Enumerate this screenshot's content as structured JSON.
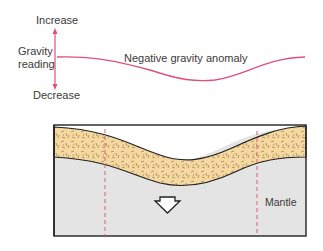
{
  "gravity_profile": {
    "axis_label_line1": "Gravity",
    "axis_label_line2": "reading",
    "increase_label": "Increase",
    "decrease_label": "Decrease",
    "curve_label": "Negative gravity anomaly",
    "curve_color": "#e0507a",
    "arrow_color": "#e0507a"
  },
  "cross_section": {
    "crust_fill": "#f5d9a0",
    "mantle_fill": "#e4e4e4",
    "outline_color": "#222222",
    "dashed_line_color": "#d9607a",
    "mantle_label": "Mantle",
    "arrow_icon": "down-arrow-outline"
  }
}
